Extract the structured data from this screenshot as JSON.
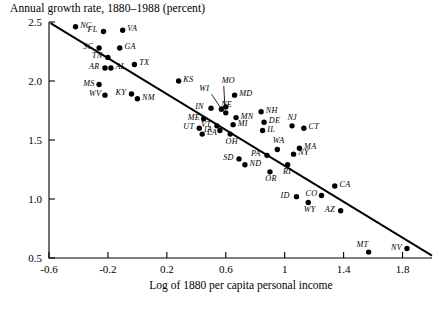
{
  "chart_data": {
    "type": "scatter",
    "title": "",
    "ylabel": "Annual growth rate, 1880–1988 (percent)",
    "xlabel": "Log of 1880 per capita personal income",
    "xlim": [
      -0.6,
      2.0
    ],
    "ylim": [
      0.5,
      2.5
    ],
    "xticks": [
      "-0.6",
      "-0.2",
      "0.2",
      "0.6",
      "1",
      "1.4",
      "1.8"
    ],
    "xtickvalues": [
      -0.6,
      -0.2,
      0.2,
      0.6,
      1.0,
      1.4,
      1.8
    ],
    "yticks": [
      "0.5",
      "1.0",
      "1.5",
      "2.0",
      "2.5"
    ],
    "ytickvalues": [
      0.5,
      1.0,
      1.5,
      2.0,
      2.5
    ],
    "grid": false,
    "legend": "none",
    "marker_color": "#000000",
    "line_color": "#000000",
    "fit_line": {
      "label": "regression line",
      "x_start": -0.59,
      "y_start": 2.49,
      "x_end": 2.0,
      "y_end": 0.52
    },
    "points": [
      {
        "label": "NC",
        "x": -0.42,
        "y": 2.46,
        "label_pos": "right"
      },
      {
        "label": "FL",
        "x": -0.23,
        "y": 2.42,
        "label_pos": "left"
      },
      {
        "label": "VA",
        "x": -0.1,
        "y": 2.43,
        "label_pos": "right"
      },
      {
        "label": "SC",
        "x": -0.26,
        "y": 2.28,
        "label_pos": "left"
      },
      {
        "label": "GA",
        "x": -0.12,
        "y": 2.28,
        "label_pos": "right"
      },
      {
        "label": "TN",
        "x": -0.2,
        "y": 2.2,
        "label_pos": "left"
      },
      {
        "label": "AR",
        "x": -0.22,
        "y": 2.11,
        "label_pos": "left"
      },
      {
        "label": "AL",
        "x": -0.18,
        "y": 2.11,
        "label_pos": "right"
      },
      {
        "label": "TX",
        "x": -0.02,
        "y": 2.14,
        "label_pos": "right"
      },
      {
        "label": "MS",
        "x": -0.26,
        "y": 1.97,
        "label_pos": "left"
      },
      {
        "label": "KS",
        "x": 0.28,
        "y": 2.0,
        "label_pos": "right"
      },
      {
        "label": "WV",
        "x": -0.22,
        "y": 1.88,
        "label_pos": "left"
      },
      {
        "label": "KY",
        "x": -0.04,
        "y": 1.89,
        "label_pos": "left"
      },
      {
        "label": "NM",
        "x": 0.0,
        "y": 1.85,
        "label_pos": "right"
      },
      {
        "label": "MO",
        "x": 0.6,
        "y": 1.78,
        "label_pos": "leader-up-right"
      },
      {
        "label": "WI",
        "x": 0.57,
        "y": 1.76,
        "label_pos": "leader-up-left"
      },
      {
        "label": "MD",
        "x": 0.66,
        "y": 1.88,
        "label_pos": "right"
      },
      {
        "label": "IN",
        "x": 0.5,
        "y": 1.77,
        "label_pos": "left"
      },
      {
        "label": "NE",
        "x": 0.6,
        "y": 1.73,
        "label_pos": "above"
      },
      {
        "label": "NH",
        "x": 0.84,
        "y": 1.74,
        "label_pos": "right"
      },
      {
        "label": "MN",
        "x": 0.67,
        "y": 1.69,
        "label_pos": "right"
      },
      {
        "label": "ME",
        "x": 0.45,
        "y": 1.68,
        "label_pos": "left"
      },
      {
        "label": "DE",
        "x": 0.86,
        "y": 1.65,
        "label_pos": "right"
      },
      {
        "label": "MI",
        "x": 0.65,
        "y": 1.63,
        "label_pos": "right"
      },
      {
        "label": "VT",
        "x": 0.54,
        "y": 1.62,
        "label_pos": "left"
      },
      {
        "label": "IL",
        "x": 0.85,
        "y": 1.58,
        "label_pos": "right"
      },
      {
        "label": "NJ",
        "x": 1.05,
        "y": 1.62,
        "label_pos": "above"
      },
      {
        "label": "CT",
        "x": 1.13,
        "y": 1.6,
        "label_pos": "right"
      },
      {
        "label": "UT",
        "x": 0.42,
        "y": 1.6,
        "label_pos": "left"
      },
      {
        "label": "IA",
        "x": 0.56,
        "y": 1.58,
        "label_pos": "left"
      },
      {
        "label": "OH",
        "x": 0.63,
        "y": 1.55,
        "label_pos": "below"
      },
      {
        "label": "LA",
        "x": 0.44,
        "y": 1.55,
        "label_pos": "right"
      },
      {
        "label": "MA",
        "x": 1.1,
        "y": 1.43,
        "label_pos": "right"
      },
      {
        "label": "WA",
        "x": 0.95,
        "y": 1.42,
        "label_pos": "above"
      },
      {
        "label": "NY",
        "x": 1.06,
        "y": 1.38,
        "label_pos": "right"
      },
      {
        "label": "PA",
        "x": 0.88,
        "y": 1.37,
        "label_pos": "left"
      },
      {
        "label": "SD",
        "x": 0.69,
        "y": 1.34,
        "label_pos": "left"
      },
      {
        "label": "ND",
        "x": 0.73,
        "y": 1.29,
        "label_pos": "right"
      },
      {
        "label": "RI",
        "x": 1.02,
        "y": 1.29,
        "label_pos": "below"
      },
      {
        "label": "OR",
        "x": 0.9,
        "y": 1.23,
        "label_pos": "below"
      },
      {
        "label": "CA",
        "x": 1.34,
        "y": 1.11,
        "label_pos": "right"
      },
      {
        "label": "CO",
        "x": 1.25,
        "y": 1.03,
        "label_pos": "left"
      },
      {
        "label": "ID",
        "x": 1.08,
        "y": 1.02,
        "label_pos": "left"
      },
      {
        "label": "WY",
        "x": 1.16,
        "y": 0.97,
        "label_pos": "below"
      },
      {
        "label": "AZ",
        "x": 1.38,
        "y": 0.9,
        "label_pos": "left"
      },
      {
        "label": "MT",
        "x": 1.57,
        "y": 0.55,
        "label_pos": "above-left"
      },
      {
        "label": "NV",
        "x": 1.83,
        "y": 0.58,
        "label_pos": "left"
      }
    ]
  },
  "caption": {
    "text": ""
  }
}
